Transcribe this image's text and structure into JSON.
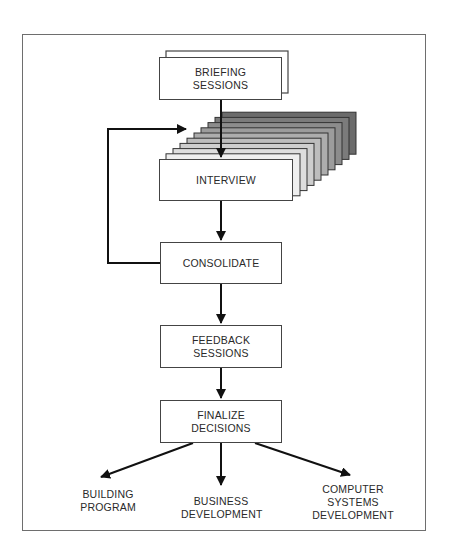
{
  "diagram": {
    "type": "flowchart",
    "nodes": {
      "briefing": {
        "line1": "BRIEFING",
        "line2": "SESSIONS"
      },
      "interview": {
        "line1": "INTERVIEW"
      },
      "consolidate": {
        "line1": "CONSOLIDATE"
      },
      "feedback": {
        "line1": "FEEDBACK",
        "line2": "SESSIONS"
      },
      "finalize": {
        "line1": "FINALIZE",
        "line2": "DECISIONS"
      }
    },
    "outputs": {
      "building": {
        "line1": "BUILDING",
        "line2": "PROGRAM"
      },
      "business": {
        "line1": "BUSINESS",
        "line2": "DEVELOPMENT"
      },
      "computer": {
        "line1": "COMPUTER",
        "line2": "SYSTEMS",
        "line3": "DEVELOPMENT"
      }
    },
    "edges": [
      {
        "from": "briefing",
        "to": "interview"
      },
      {
        "from": "interview",
        "to": "consolidate"
      },
      {
        "from": "consolidate",
        "to": "interview",
        "kind": "loop"
      },
      {
        "from": "consolidate",
        "to": "feedback"
      },
      {
        "from": "feedback",
        "to": "finalize"
      },
      {
        "from": "finalize",
        "to": "building"
      },
      {
        "from": "finalize",
        "to": "business"
      },
      {
        "from": "finalize",
        "to": "computer"
      }
    ],
    "interview_stack": {
      "count": 10,
      "gray_start": "#ffffff",
      "gray_end": "#6b6b6b"
    },
    "colors": {
      "line": "#111111",
      "box_border": "#444444",
      "text": "#2a2a2a"
    }
  }
}
